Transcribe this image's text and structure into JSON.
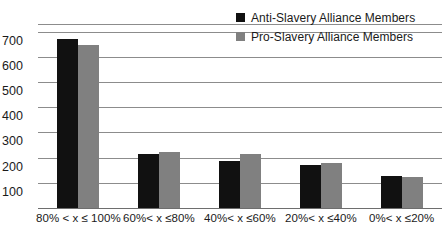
{
  "chart_data": {
    "type": "bar",
    "title": "",
    "subtitle": "",
    "xlabel": "",
    "ylabel": "",
    "grid": true,
    "legend_position": "top-right",
    "ylim": [
      0,
      730
    ],
    "yticks": [
      100,
      200,
      300,
      400,
      500,
      600,
      700
    ],
    "ytick_labels": [
      "100",
      "200",
      "300",
      "400",
      "500",
      "600",
      "700"
    ],
    "categories": [
      "80% < x ≤ 100%",
      "60%< x ≤80%",
      "40%< x ≤60%",
      "20%< x ≤40%",
      "0%< x ≤20%"
    ],
    "series": [
      {
        "name": "Anti-Slavery Alliance Members",
        "color": "#111111",
        "values": [
          672,
          213,
          185,
          170,
          127
        ]
      },
      {
        "name": "Pro-Slavery Alliance Members",
        "color": "#808080",
        "values": [
          648,
          221,
          213,
          180,
          122
        ]
      }
    ]
  },
  "legend": {
    "items": [
      {
        "label": "Anti-Slavery Alliance Members",
        "swatch": "anti"
      },
      {
        "label": "Pro-Slavery Alliance Members",
        "swatch": "pro"
      }
    ]
  }
}
